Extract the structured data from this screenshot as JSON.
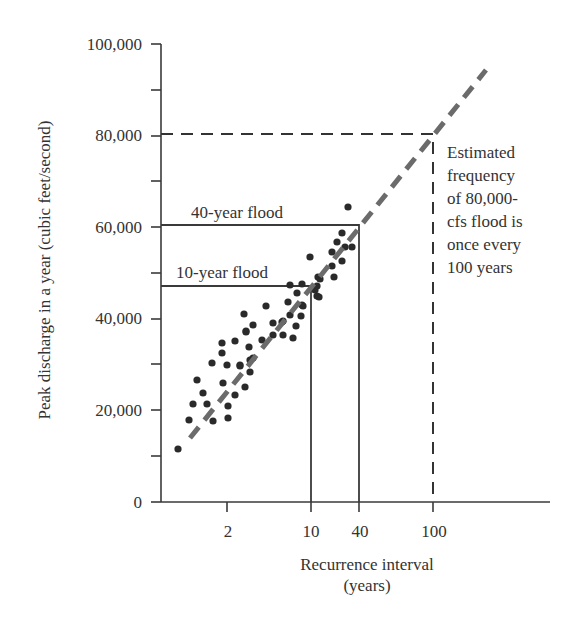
{
  "chart_data": {
    "type": "scatter",
    "title": "",
    "xlabel": "Recurrence interval (years)",
    "xlabel_lines": [
      "Recurrence interval",
      "(years)"
    ],
    "ylabel": "Peak discharge in a year (cubic feet/second)",
    "x_scale": "log (schematic)",
    "x_ticks": [
      {
        "label": "2",
        "px": 227
      },
      {
        "label": "10",
        "px": 311
      },
      {
        "label": "40",
        "px": 359
      },
      {
        "label": "100",
        "px": 433
      }
    ],
    "y_ticks": [
      {
        "label": "0",
        "value": 0
      },
      {
        "label": "20,000",
        "value": 20000
      },
      {
        "label": "40,000",
        "value": 40000
      },
      {
        "label": "60,000",
        "value": 60000
      },
      {
        "label": "80,000",
        "value": 80000
      },
      {
        "label": "100,000",
        "value": 100000
      }
    ],
    "y_minor_ticks": [
      10000,
      30000,
      50000,
      70000,
      90000
    ],
    "ylim": [
      0,
      100000
    ],
    "grid": false,
    "legend": null,
    "series": [
      {
        "name": "Annual peak discharges",
        "marker": "filled-circle",
        "color": "#2a2a2a",
        "points_px": [
          [
            178,
            449
          ],
          [
            189,
            420
          ],
          [
            193,
            404
          ],
          [
            197,
            380
          ],
          [
            203,
            393
          ],
          [
            207,
            404
          ],
          [
            213,
            421
          ],
          [
            212,
            363
          ],
          [
            222,
            353
          ],
          [
            222,
            343
          ],
          [
            223,
            383
          ],
          [
            227,
            365
          ],
          [
            228,
            406
          ],
          [
            228,
            418
          ],
          [
            235,
            395
          ],
          [
            235,
            341
          ],
          [
            240,
            365
          ],
          [
            240,
            366
          ],
          [
            244,
            314
          ],
          [
            245,
            387
          ],
          [
            246,
            331
          ],
          [
            246,
            332
          ],
          [
            249,
            347
          ],
          [
            250,
            372
          ],
          [
            250,
            360
          ],
          [
            253,
            325
          ],
          [
            253,
            358
          ],
          [
            262,
            340
          ],
          [
            266,
            306
          ],
          [
            273,
            323
          ],
          [
            273,
            335
          ],
          [
            282,
            322
          ],
          [
            283,
            335
          ],
          [
            283,
            321
          ],
          [
            288,
            302
          ],
          [
            290,
            315
          ],
          [
            290,
            285
          ],
          [
            293,
            338
          ],
          [
            296,
            326
          ],
          [
            297,
            293
          ],
          [
            301,
            316
          ],
          [
            302,
            305
          ],
          [
            302,
            284
          ],
          [
            303,
            306
          ],
          [
            310,
            257
          ],
          [
            315,
            290
          ],
          [
            317,
            296
          ],
          [
            317,
            286
          ],
          [
            318,
            277
          ],
          [
            319,
            297
          ],
          [
            320,
            279
          ],
          [
            332,
            252
          ],
          [
            332,
            266
          ],
          [
            334,
            277
          ],
          [
            337,
            242
          ],
          [
            342,
            233
          ],
          [
            342,
            261
          ],
          [
            345,
            247
          ],
          [
            348,
            207
          ],
          [
            352,
            247
          ]
        ]
      },
      {
        "name": "Trend line",
        "style": "dashed",
        "color": "#6b6b6b",
        "from_px": [
          190,
          438
        ],
        "to_px": [
          486,
          70
        ]
      }
    ],
    "reference_lines": [
      {
        "label": "10-year flood",
        "recurrence_years": 10,
        "discharge": 47000
      },
      {
        "label": "40-year flood",
        "recurrence_years": 40,
        "discharge": 60000
      },
      {
        "label": "80,000-cfs estimate",
        "recurrence_years": 100,
        "discharge": 80000,
        "style": "dashed"
      }
    ],
    "annotations": [
      "40-year flood",
      "10-year flood",
      "Estimated frequency of 80,000-cfs flood is once every 100 years"
    ]
  },
  "labels": {
    "flood40": "40-year flood",
    "flood10": "10-year flood",
    "note_lines": [
      "Estimated",
      "frequency",
      "of 80,000-",
      "cfs flood is",
      "once every",
      "100 years"
    ],
    "ylabel": "Peak discharge in a year (cubic feet/second)",
    "xlabel1": "Recurrence interval",
    "xlabel2": "(years)",
    "yticks": [
      "0",
      "20,000",
      "40,000",
      "60,000",
      "80,000",
      "100,000"
    ],
    "xticks": [
      "2",
      "10",
      "40",
      "100"
    ]
  },
  "colors": {
    "axis": "#3a3a3a",
    "points": "#2a2a2a",
    "trend": "#6b6b6b",
    "text": "#333333"
  }
}
